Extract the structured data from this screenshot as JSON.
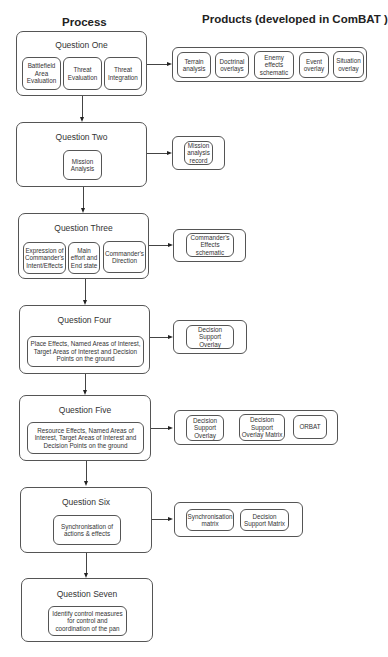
{
  "headers": {
    "process": "Process",
    "products": "Products  (developed in ComBAT )"
  },
  "questions": [
    {
      "title": "Question One",
      "steps": [
        "Battlefield Area Evaluation",
        "Threat Evaluation",
        "Threat Integration"
      ],
      "products": [
        "Terrain analysis",
        "Doctrinal overlays",
        "Enemy effects schematic",
        "Event overlay",
        "Situation overlay"
      ]
    },
    {
      "title": "Question Two",
      "steps": [
        "Mission Analysis"
      ],
      "products": [
        "Mission analysis record"
      ]
    },
    {
      "title": "Question Three",
      "steps": [
        "Expression of Commander's Intent/Effects",
        "Main effort and End state",
        "Commander's Direction"
      ],
      "products": [
        "Commander's Effects schematic"
      ]
    },
    {
      "title": "Question Four",
      "steps": [
        "Place Effects, Named Areas of Interest, Target Areas of Interest and Decision Points on the ground"
      ],
      "products": [
        "Decision Support Overlay"
      ]
    },
    {
      "title": "Question Five",
      "steps": [
        "Resource Effects, Named Areas of Interest, Target Areas of Interest and Decision Points on the ground"
      ],
      "products": [
        "Decision Support Overlay",
        "Decision Support Overlay Matrix",
        "ORBAT"
      ]
    },
    {
      "title": "Question Six",
      "steps": [
        "Synchronisation of actions & effects"
      ],
      "products": [
        "Synchronisation matrix",
        "Decision Support Matrix"
      ]
    },
    {
      "title": "Question Seven",
      "steps": [
        "Identify control measures for control and coordination of the pan"
      ],
      "products": []
    }
  ],
  "colors": {
    "line": "#444444",
    "border": "#555555",
    "text": "#333333",
    "background": "#ffffff"
  }
}
